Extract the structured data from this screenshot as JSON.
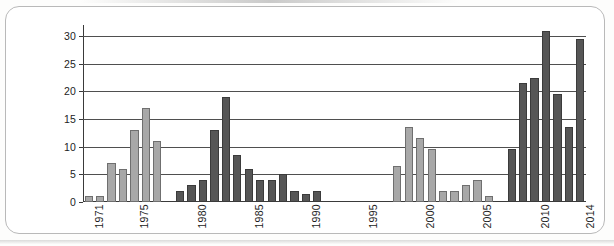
{
  "chart_data": {
    "type": "bar",
    "title": "",
    "subtitle": "",
    "xlabel": "",
    "ylabel": "",
    "ylim": [
      0,
      32
    ],
    "y_ticks": [
      0,
      5,
      10,
      15,
      20,
      25,
      30
    ],
    "y_tick_labels": [
      "0",
      "5",
      "10",
      "15",
      "20",
      "25",
      "30"
    ],
    "grid": true,
    "legend": "none",
    "x_tick_labels": [
      "1971",
      "1975",
      "1980",
      "1985",
      "1990",
      "1995",
      "2000",
      "2005",
      "2010",
      "2014"
    ],
    "categories": [
      "1971",
      "1972",
      "1973",
      "1974",
      "1975",
      "1976",
      "1977",
      "1978",
      "1979",
      "1980",
      "1981",
      "1982",
      "1983",
      "1984",
      "1985",
      "1986",
      "1987",
      "1988",
      "1989",
      "1990",
      "1991",
      "1992",
      "1993",
      "1994",
      "1995",
      "1996",
      "1997",
      "1998",
      "1999",
      "2000",
      "2001",
      "2002",
      "2003",
      "2004",
      "2005",
      "2006",
      "2007",
      "2008",
      "2009",
      "2010",
      "2011",
      "2012",
      "2013",
      "2014"
    ],
    "values": [
      1,
      1,
      7,
      6,
      13,
      17,
      11,
      0,
      2,
      3,
      4,
      13,
      19,
      8.5,
      6,
      4,
      4,
      5,
      2,
      1.5,
      2,
      0,
      0,
      0,
      0,
      0,
      0,
      6.5,
      13.5,
      11.5,
      9.5,
      2,
      2,
      3,
      4,
      1,
      0,
      9.5,
      21.5,
      22.5,
      31,
      19.5,
      13.5,
      29.5
    ],
    "bar_shades": [
      "light",
      "light",
      "light",
      "light",
      "light",
      "light",
      "light",
      "light",
      "dark",
      "dark",
      "dark",
      "dark",
      "dark",
      "dark",
      "dark",
      "dark",
      "dark",
      "dark",
      "dark",
      "dark",
      "dark",
      "dark",
      "dark",
      "dark",
      "dark",
      "dark",
      "dark",
      "light",
      "light",
      "light",
      "light",
      "light",
      "light",
      "light",
      "light",
      "light",
      "dark",
      "dark",
      "dark",
      "dark",
      "dark",
      "dark",
      "dark",
      "dark"
    ],
    "colors": {
      "light_bar": "#a8a8a8",
      "light_bar_border": "#6f6f6f",
      "dark_bar": "#565656",
      "dark_bar_border": "#3b3b3b",
      "gridline": "#4f4f4f",
      "axis": "#3a3a3a",
      "card_border": "#b9b9b9",
      "background": "#ffffff",
      "text": "#1d1d1d"
    }
  }
}
